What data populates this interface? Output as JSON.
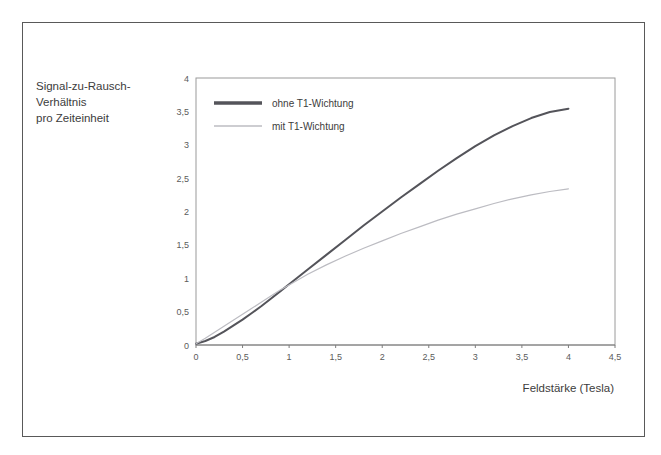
{
  "chart_data": {
    "type": "line",
    "title": "",
    "xlabel": "Feldstärke (Tesla)",
    "ylabel": "Signal-zu-Rausch-Verhältnis pro Zeiteinheit",
    "ylabel_lines": [
      "Signal-zu-Rausch-",
      "Verhältnis",
      "pro Zeiteinheit"
    ],
    "xlim": [
      0,
      4.5
    ],
    "ylim": [
      0,
      4
    ],
    "xticks": [
      0,
      0.5,
      1,
      1.5,
      2,
      2.5,
      3,
      3.5,
      4,
      4.5
    ],
    "yticks": [
      0,
      0.5,
      1,
      1.5,
      2,
      2.5,
      3,
      3.5,
      4
    ],
    "xtick_labels": [
      "0",
      "0,5",
      "1",
      "1,5",
      "2",
      "2,5",
      "3",
      "3,5",
      "4",
      "4,5"
    ],
    "ytick_labels": [
      "0",
      "0,5",
      "1",
      "1,5",
      "2",
      "2,5",
      "3",
      "3,5",
      "4"
    ],
    "grid": false,
    "legend_position": "top-left",
    "x": [
      0,
      0.1,
      0.2,
      0.3,
      0.4,
      0.5,
      0.6,
      0.7,
      0.8,
      0.9,
      1,
      1.2,
      1.4,
      1.6,
      1.8,
      2,
      2.2,
      2.4,
      2.6,
      2.8,
      3,
      3.2,
      3.4,
      3.6,
      3.8,
      4
    ],
    "series": [
      {
        "name": "ohne T1-Wichtung",
        "color": "#54545a",
        "width": 2.0,
        "values": [
          0.02,
          0.06,
          0.12,
          0.2,
          0.29,
          0.38,
          0.48,
          0.58,
          0.69,
          0.8,
          0.91,
          1.13,
          1.35,
          1.57,
          1.79,
          2.0,
          2.21,
          2.41,
          2.61,
          2.8,
          2.98,
          3.14,
          3.28,
          3.4,
          3.49,
          3.54
        ]
      },
      {
        "name": "mit T1-Wichtung",
        "color": "#bcbcc2",
        "width": 1.2,
        "values": [
          0.02,
          0.1,
          0.19,
          0.28,
          0.37,
          0.46,
          0.55,
          0.64,
          0.73,
          0.82,
          0.9,
          1.06,
          1.2,
          1.33,
          1.45,
          1.56,
          1.67,
          1.77,
          1.87,
          1.96,
          2.04,
          2.12,
          2.19,
          2.25,
          2.3,
          2.34
        ]
      }
    ]
  },
  "legend": {
    "entries": [
      {
        "label": "ohne T1-Wichtung"
      },
      {
        "label": "mit T1-Wichtung"
      }
    ]
  },
  "colors": {
    "series_dark": "#54545a",
    "series_light": "#bcbcc2",
    "frame": "#595959",
    "axis": "#7d7d7d",
    "text": "#3c3c3c",
    "tick_text": "#5b5b5b",
    "background": "#ffffff"
  }
}
